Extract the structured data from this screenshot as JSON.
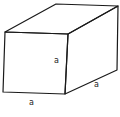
{
  "figure": {
    "type": "cuboid",
    "colors": {
      "stroke": "#1a1a1a",
      "background": "#ffffff"
    },
    "labels": {
      "height": "a",
      "width": "a",
      "depth": "a"
    },
    "caption": ""
  }
}
